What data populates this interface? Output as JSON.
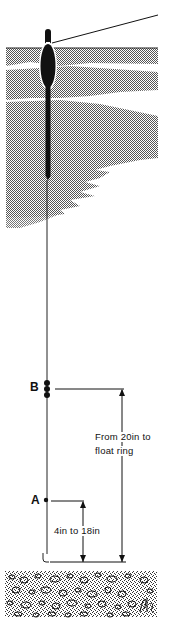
{
  "diagram": {
    "labels": {
      "point_b": "B",
      "point_a": "A",
      "b_distance_line1": "From 20in to",
      "b_distance_line2": "float ring",
      "a_distance": "4in to 18in"
    },
    "elements": [
      "rod-line",
      "float",
      "water-surface",
      "water-shading",
      "main-line",
      "shot-cluster-b",
      "shot-a",
      "hook",
      "dimension-arrow-b",
      "dimension-arrow-a",
      "gravel-bed",
      "artist-signature"
    ],
    "colors": {
      "ink": "#111111",
      "water": "#8a8a8a",
      "background": "#ffffff"
    }
  }
}
